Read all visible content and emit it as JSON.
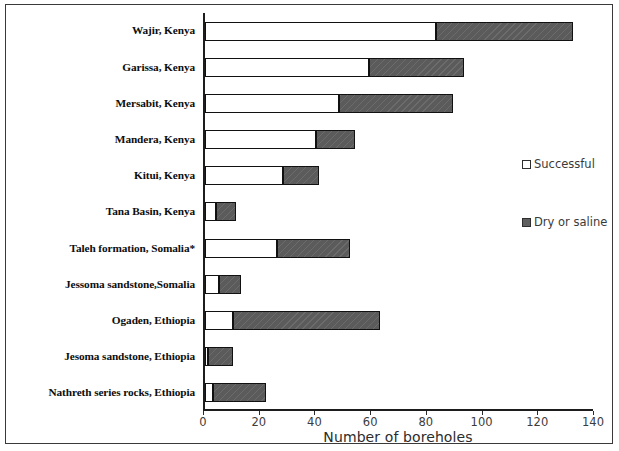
{
  "chart_data": {
    "type": "bar",
    "orientation": "horizontal",
    "stacked": true,
    "title": "",
    "xlabel": "Number of boreholes",
    "ylabel": "",
    "xlim": [
      0,
      140
    ],
    "xticks": [
      0,
      20,
      40,
      60,
      80,
      100,
      120,
      140
    ],
    "grid": false,
    "legend_position": "right",
    "categories": [
      "Wajir, Kenya",
      "Garissa, Kenya",
      "Mersabit, Kenya",
      "Mandera, Kenya",
      "Kitui, Kenya",
      "Tana Basin, Kenya",
      "Taleh formation, Somalia*",
      "Jessoma sandstone,Somalia",
      "Ogaden, Ethiopia",
      "Jesoma sandstone, Ethiopia",
      "Nathreth series rocks, Ethiopia"
    ],
    "series": [
      {
        "name": "Successful",
        "color": "#ffffff",
        "values": [
          83,
          59,
          48,
          40,
          28,
          4,
          26,
          5,
          10,
          1,
          3
        ]
      },
      {
        "name": "Dry or saline",
        "color": "#5b5b5b",
        "values": [
          49,
          34,
          41,
          14,
          13,
          7,
          26,
          8,
          53,
          9,
          19
        ]
      }
    ],
    "totals": [
      132,
      93,
      89,
      54,
      41,
      11,
      52,
      13,
      63,
      10,
      22
    ]
  },
  "axis": {
    "x_title": "Number of boreholes",
    "tick_labels": [
      "0",
      "20",
      "40",
      "60",
      "80",
      "100",
      "120",
      "140"
    ]
  },
  "legend": {
    "items": [
      {
        "label": "Successful",
        "swatch": "white-square-icon"
      },
      {
        "label": "Dry or saline",
        "swatch": "gray-square-icon"
      }
    ]
  }
}
